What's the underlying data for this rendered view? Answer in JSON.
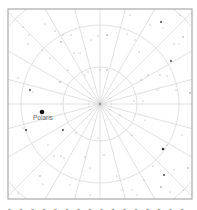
{
  "chart_title": "Polar star chart",
  "frame": {
    "x": 8,
    "y": 9,
    "width": 184,
    "height": 190,
    "stroke": "#aaaaaa"
  },
  "center": {
    "x": 100,
    "y": 104
  },
  "grid": {
    "circle_radii": [
      37,
      79,
      120
    ],
    "radial_line_count": 24,
    "radial_step_deg": 15,
    "line_color": "#d8d8d8"
  },
  "labels": {
    "polaris": "Polaris",
    "caption": "- - - -   - - - -   - - -   - - -   - -"
  },
  "highlight_star": {
    "name": "Polaris",
    "x": 42,
    "y": 112,
    "r": 2.3,
    "color": "#111111"
  },
  "stars": [
    {
      "x": 28,
      "y": 44,
      "r": 0.6
    },
    {
      "x": 29,
      "y": 35,
      "r": 0.5
    },
    {
      "x": 55,
      "y": 31,
      "r": 0.6
    },
    {
      "x": 63,
      "y": 35,
      "r": 0.5
    },
    {
      "x": 61,
      "y": 42,
      "r": 0.8
    },
    {
      "x": 71,
      "y": 35,
      "r": 0.5
    },
    {
      "x": 74,
      "y": 53,
      "r": 0.6
    },
    {
      "x": 80,
      "y": 53,
      "r": 0.5
    },
    {
      "x": 68,
      "y": 70,
      "r": 0.6
    },
    {
      "x": 85,
      "y": 75,
      "r": 0.5
    },
    {
      "x": 88,
      "y": 72,
      "r": 0.5
    },
    {
      "x": 60,
      "y": 82,
      "r": 0.7
    },
    {
      "x": 30,
      "y": 90,
      "r": 0.9
    },
    {
      "x": 33,
      "y": 92,
      "r": 0.5
    },
    {
      "x": 18,
      "y": 78,
      "r": 0.6
    },
    {
      "x": 42,
      "y": 50,
      "r": 0.5
    },
    {
      "x": 50,
      "y": 58,
      "r": 0.5
    },
    {
      "x": 98,
      "y": 36,
      "r": 0.6
    },
    {
      "x": 107,
      "y": 35,
      "r": 0.8
    },
    {
      "x": 91,
      "y": 40,
      "r": 0.5
    },
    {
      "x": 100,
      "y": 70,
      "r": 0.5
    },
    {
      "x": 107,
      "y": 70,
      "r": 0.7
    },
    {
      "x": 127,
      "y": 34,
      "r": 0.5
    },
    {
      "x": 135,
      "y": 40,
      "r": 0.5
    },
    {
      "x": 139,
      "y": 52,
      "r": 0.6
    },
    {
      "x": 150,
      "y": 25,
      "r": 0.6
    },
    {
      "x": 161,
      "y": 22,
      "r": 0.9
    },
    {
      "x": 163,
      "y": 28,
      "r": 0.5
    },
    {
      "x": 174,
      "y": 44,
      "r": 0.6
    },
    {
      "x": 179,
      "y": 44,
      "r": 0.5
    },
    {
      "x": 183,
      "y": 37,
      "r": 0.7
    },
    {
      "x": 171,
      "y": 61,
      "r": 0.9
    },
    {
      "x": 160,
      "y": 75,
      "r": 0.6
    },
    {
      "x": 148,
      "y": 75,
      "r": 0.6
    },
    {
      "x": 141,
      "y": 80,
      "r": 0.5
    },
    {
      "x": 167,
      "y": 76,
      "r": 0.5
    },
    {
      "x": 176,
      "y": 90,
      "r": 0.5
    },
    {
      "x": 190,
      "y": 93,
      "r": 0.8
    },
    {
      "x": 157,
      "y": 90,
      "r": 0.5
    },
    {
      "x": 143,
      "y": 101,
      "r": 0.5
    },
    {
      "x": 134,
      "y": 101,
      "r": 0.5
    },
    {
      "x": 26,
      "y": 130,
      "r": 1.0
    },
    {
      "x": 23,
      "y": 128,
      "r": 0.5
    },
    {
      "x": 63,
      "y": 130,
      "r": 0.9
    },
    {
      "x": 76,
      "y": 133,
      "r": 0.5
    },
    {
      "x": 48,
      "y": 145,
      "r": 0.5
    },
    {
      "x": 54,
      "y": 156,
      "r": 0.6
    },
    {
      "x": 61,
      "y": 156,
      "r": 0.6
    },
    {
      "x": 64,
      "y": 158,
      "r": 0.5
    },
    {
      "x": 40,
      "y": 176,
      "r": 0.7
    },
    {
      "x": 43,
      "y": 184,
      "r": 0.5
    },
    {
      "x": 18,
      "y": 193,
      "r": 0.5
    },
    {
      "x": 85,
      "y": 157,
      "r": 0.6
    },
    {
      "x": 90,
      "y": 168,
      "r": 0.5
    },
    {
      "x": 98,
      "y": 138,
      "r": 0.5
    },
    {
      "x": 104,
      "y": 155,
      "r": 0.6
    },
    {
      "x": 132,
      "y": 135,
      "r": 0.5
    },
    {
      "x": 163,
      "y": 149,
      "r": 1.3
    },
    {
      "x": 167,
      "y": 145,
      "r": 0.5
    },
    {
      "x": 153,
      "y": 166,
      "r": 0.6
    },
    {
      "x": 164,
      "y": 175,
      "r": 0.9
    },
    {
      "x": 174,
      "y": 170,
      "r": 0.5
    },
    {
      "x": 188,
      "y": 168,
      "r": 0.7
    },
    {
      "x": 161,
      "y": 187,
      "r": 0.8
    },
    {
      "x": 170,
      "y": 192,
      "r": 0.5
    },
    {
      "x": 144,
      "y": 180,
      "r": 0.5
    },
    {
      "x": 132,
      "y": 190,
      "r": 0.5
    },
    {
      "x": 137,
      "y": 195,
      "r": 0.5
    },
    {
      "x": 183,
      "y": 190,
      "r": 0.5
    },
    {
      "x": 120,
      "y": 115,
      "r": 0.5
    },
    {
      "x": 145,
      "y": 120,
      "r": 0.5
    },
    {
      "x": 182,
      "y": 135,
      "r": 0.5
    },
    {
      "x": 45,
      "y": 24,
      "r": 0.5
    },
    {
      "x": 23,
      "y": 27,
      "r": 0.5
    },
    {
      "x": 130,
      "y": 15,
      "r": 0.5
    },
    {
      "x": 180,
      "y": 15,
      "r": 0.5
    },
    {
      "x": 90,
      "y": 195,
      "r": 0.5
    },
    {
      "x": 70,
      "y": 185,
      "r": 0.5
    },
    {
      "x": 117,
      "y": 176,
      "r": 0.5
    },
    {
      "x": 122,
      "y": 190,
      "r": 0.5
    }
  ]
}
